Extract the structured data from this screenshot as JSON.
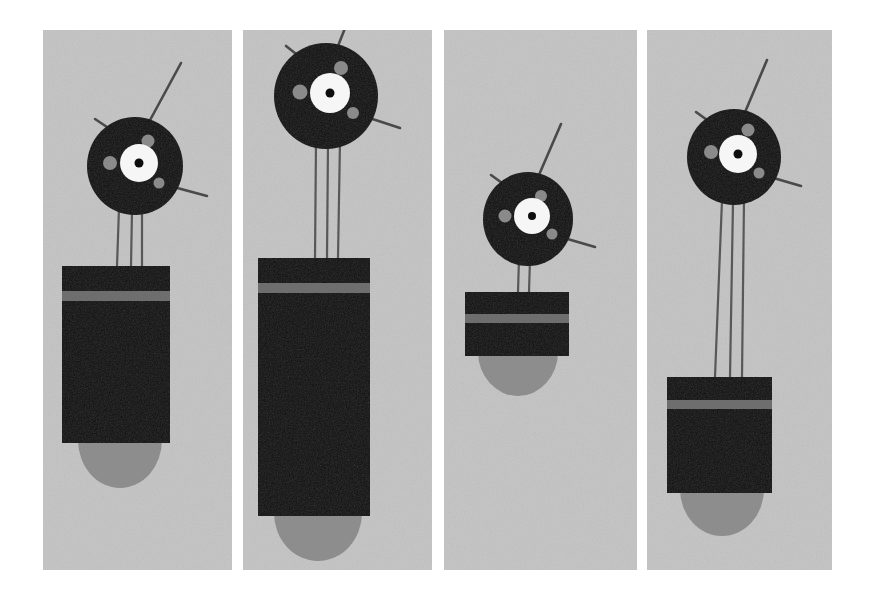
{
  "image": {
    "title": "Four-panel robot figure illustration",
    "width": 875,
    "height": 603,
    "background_color": "#ffffff",
    "panel_background_color": "#c3c3c3",
    "figure_color": "#0d0d0d",
    "band_color": "#6e6e6e",
    "shadow_color": "#8d8d8d",
    "eye_ring_color": "#f6f6f6",
    "eye_pupil_color": "#0d0d0d",
    "dot_color": "#8a8a8a",
    "antenna_color": "#4a4a4a",
    "leg_color": "#585858",
    "panel_count": 4
  },
  "panels": [
    {
      "id": "panel-1",
      "label": "Panel 1",
      "x": 43,
      "y": 30,
      "width": 189,
      "height": 540,
      "head": {
        "cx": 135,
        "cy": 166,
        "rx": 48,
        "ry": 49
      },
      "eye": {
        "cx": 139,
        "cy": 163,
        "ring_r": 19,
        "pupil_r": 4.5
      },
      "dots": [
        {
          "cx": 110,
          "cy": 163,
          "r": 7
        },
        {
          "cx": 148,
          "cy": 141,
          "r": 6.5
        },
        {
          "cx": 159,
          "cy": 183,
          "r": 5.5
        }
      ],
      "antennae": [
        {
          "x1": 136,
          "y1": 146,
          "x2": 181,
          "y2": 63
        },
        {
          "x1": 116,
          "y1": 133,
          "x2": 95,
          "y2": 119
        },
        {
          "x1": 155,
          "y1": 182,
          "x2": 207,
          "y2": 196
        }
      ],
      "legs": [
        {
          "x1": 119,
          "y1": 208,
          "x2": 117,
          "y2": 266
        },
        {
          "x1": 132,
          "y1": 211,
          "x2": 131,
          "y2": 266
        },
        {
          "x1": 142,
          "y1": 210,
          "x2": 142,
          "y2": 266
        }
      ],
      "body": {
        "x": 62,
        "y": 266,
        "width": 108,
        "height": 177
      },
      "band": {
        "x": 62,
        "y": 291,
        "width": 108,
        "height": 10
      },
      "shadow": {
        "cx": 120,
        "cy": 440,
        "rx": 42,
        "ry": 48
      }
    },
    {
      "id": "panel-2",
      "label": "Panel 2",
      "x": 243,
      "y": 30,
      "width": 189,
      "height": 540,
      "head": {
        "cx": 326,
        "cy": 96,
        "rx": 52,
        "ry": 53
      },
      "eye": {
        "cx": 330,
        "cy": 93,
        "ring_r": 20,
        "pupil_r": 4.5
      },
      "dots": [
        {
          "cx": 300,
          "cy": 92,
          "r": 7.5
        },
        {
          "cx": 341,
          "cy": 68,
          "r": 7
        },
        {
          "cx": 353,
          "cy": 113,
          "r": 6
        }
      ],
      "antennae": [
        {
          "x1": 327,
          "y1": 74,
          "x2": 349,
          "y2": 18
        },
        {
          "x1": 305,
          "y1": 61,
          "x2": 286,
          "y2": 46
        },
        {
          "x1": 348,
          "y1": 111,
          "x2": 400,
          "y2": 128
        }
      ],
      "legs": [
        {
          "x1": 316,
          "y1": 141,
          "x2": 315,
          "y2": 258
        },
        {
          "x1": 328,
          "y1": 143,
          "x2": 327,
          "y2": 258
        },
        {
          "x1": 340,
          "y1": 141,
          "x2": 338,
          "y2": 258
        }
      ],
      "body": {
        "x": 258,
        "y": 258,
        "width": 112,
        "height": 258
      },
      "band": {
        "x": 258,
        "y": 283,
        "width": 112,
        "height": 10
      },
      "shadow": {
        "cx": 318,
        "cy": 513,
        "rx": 44,
        "ry": 48
      }
    },
    {
      "id": "panel-3",
      "label": "Panel 3",
      "x": 444,
      "y": 30,
      "width": 193,
      "height": 540,
      "head": {
        "cx": 528,
        "cy": 219,
        "rx": 45,
        "ry": 47
      },
      "eye": {
        "cx": 532,
        "cy": 216,
        "ring_r": 18,
        "pupil_r": 4
      },
      "dots": [
        {
          "cx": 505,
          "cy": 216,
          "r": 6.5
        },
        {
          "cx": 541,
          "cy": 196,
          "r": 6
        },
        {
          "cx": 552,
          "cy": 234,
          "r": 5.5
        }
      ],
      "antennae": [
        {
          "x1": 529,
          "y1": 198,
          "x2": 561,
          "y2": 124
        },
        {
          "x1": 509,
          "y1": 188,
          "x2": 491,
          "y2": 175
        },
        {
          "x1": 547,
          "y1": 233,
          "x2": 595,
          "y2": 247
        }
      ],
      "legs": [
        {
          "x1": 519,
          "y1": 258,
          "x2": 518,
          "y2": 292
        },
        {
          "x1": 530,
          "y1": 259,
          "x2": 529,
          "y2": 292
        }
      ],
      "body": {
        "x": 465,
        "y": 292,
        "width": 104,
        "height": 64
      },
      "band": {
        "x": 465,
        "y": 314,
        "width": 104,
        "height": 9
      },
      "shadow": {
        "cx": 518,
        "cy": 352,
        "rx": 40,
        "ry": 44
      }
    },
    {
      "id": "panel-4",
      "label": "Panel 4",
      "x": 647,
      "y": 30,
      "width": 185,
      "height": 540,
      "head": {
        "cx": 734,
        "cy": 157,
        "rx": 47,
        "ry": 48
      },
      "eye": {
        "cx": 738,
        "cy": 154,
        "ring_r": 19,
        "pupil_r": 4.5
      },
      "dots": [
        {
          "cx": 711,
          "cy": 152,
          "r": 7
        },
        {
          "cx": 748,
          "cy": 130,
          "r": 6.5
        },
        {
          "cx": 759,
          "cy": 173,
          "r": 5.5
        }
      ],
      "antennae": [
        {
          "x1": 735,
          "y1": 136,
          "x2": 767,
          "y2": 60
        },
        {
          "x1": 714,
          "y1": 125,
          "x2": 696,
          "y2": 112
        },
        {
          "x1": 753,
          "y1": 172,
          "x2": 801,
          "y2": 186
        }
      ],
      "legs": [
        {
          "x1": 722,
          "y1": 200,
          "x2": 715,
          "y2": 377
        },
        {
          "x1": 733,
          "y1": 202,
          "x2": 730,
          "y2": 377
        },
        {
          "x1": 744,
          "y1": 200,
          "x2": 742,
          "y2": 377
        }
      ],
      "body": {
        "x": 667,
        "y": 377,
        "width": 105,
        "height": 116
      },
      "band": {
        "x": 667,
        "y": 400,
        "width": 105,
        "height": 9
      },
      "shadow": {
        "cx": 722,
        "cy": 489,
        "rx": 42,
        "ry": 47
      }
    }
  ]
}
